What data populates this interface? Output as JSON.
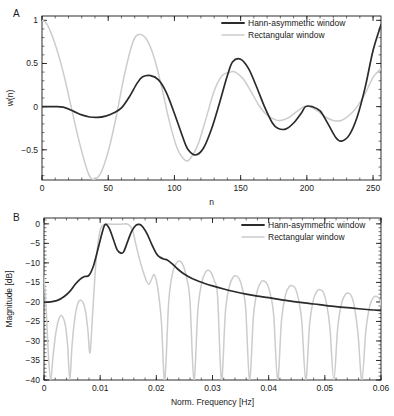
{
  "figure": {
    "width": 394,
    "height": 416,
    "background": "#ffffff",
    "series_colors": {
      "hann_asymmetric": "#2b2b2b",
      "rectangular": "#cccccc"
    }
  },
  "panels": [
    {
      "letter": "A",
      "legend": {
        "entries": [
          {
            "label": "Hann-asymmetric window",
            "color": "#2b2b2b"
          },
          {
            "label": "Rectangular window",
            "color": "#cccccc"
          }
        ]
      },
      "chart_data": {
        "type": "line",
        "title": "",
        "xlabel": "n",
        "ylabel": "w(n)",
        "xlim": [
          0,
          256
        ],
        "ylim": [
          -0.85,
          1.05
        ],
        "xticks": [
          0,
          50,
          100,
          150,
          200,
          250
        ],
        "xticklabels": [
          "0",
          "50",
          "100",
          "150",
          "200",
          "250"
        ],
        "yticks": [
          1,
          0.5,
          0,
          -0.5
        ],
        "yticklabels": [
          "1",
          "0.5",
          "0",
          "−0.5"
        ],
        "x_minor_step": 10,
        "y_minor_step": 0.1,
        "grid": false,
        "legend_position": "top-right",
        "series": [
          {
            "name": "Hann-asymmetric window",
            "color": "#2b2b2b",
            "x": [
              0,
              8,
              16,
              24,
              30,
              36,
              42,
              48,
              54,
              60,
              66,
              72,
              76,
              82,
              88,
              94,
              100,
              106,
              110,
              116,
              122,
              128,
              134,
              140,
              144,
              150,
              156,
              162,
              168,
              174,
              178,
              184,
              190,
              196,
              199,
              204,
              210,
              216,
              222,
              226,
              232,
              238,
              244,
              250,
              256
            ],
            "y": [
              0.0,
              0.0,
              -0.005,
              -0.055,
              -0.095,
              -0.12,
              -0.125,
              -0.11,
              -0.075,
              -0.015,
              0.115,
              0.275,
              0.345,
              0.36,
              0.31,
              0.16,
              -0.08,
              -0.34,
              -0.49,
              -0.56,
              -0.48,
              -0.26,
              0.04,
              0.36,
              0.52,
              0.55,
              0.44,
              0.23,
              0.0,
              -0.19,
              -0.25,
              -0.26,
              -0.19,
              -0.07,
              0.0,
              0.0,
              -0.05,
              -0.2,
              -0.36,
              -0.4,
              -0.33,
              -0.12,
              0.22,
              0.65,
              0.95
            ]
          },
          {
            "name": "Rectangular window",
            "color": "#cccccc",
            "x": [
              0,
              4,
              10,
              16,
              22,
              28,
              34,
              38,
              44,
              50,
              56,
              62,
              68,
              72,
              78,
              84,
              90,
              96,
              102,
              108,
              112,
              118,
              124,
              130,
              136,
              142,
              146,
              152,
              158,
              164,
              170,
              176,
              180,
              186,
              192,
              198,
              202,
              208,
              214,
              220,
              226,
              232,
              238,
              244,
              250,
              256
            ],
            "y": [
              1.0,
              0.95,
              0.72,
              0.4,
              0.0,
              -0.4,
              -0.73,
              -0.84,
              -0.78,
              -0.52,
              -0.12,
              0.35,
              0.72,
              0.83,
              0.8,
              0.6,
              0.25,
              -0.16,
              -0.48,
              -0.62,
              -0.6,
              -0.43,
              -0.13,
              0.18,
              0.36,
              0.4,
              0.4,
              0.32,
              0.17,
              0.01,
              -0.1,
              -0.15,
              -0.16,
              -0.13,
              -0.06,
              0.0,
              0.0,
              -0.05,
              -0.12,
              -0.16,
              -0.16,
              -0.1,
              0.0,
              0.15,
              0.34,
              0.44
            ]
          }
        ]
      }
    },
    {
      "letter": "B",
      "legend": {
        "entries": [
          {
            "label": "Hann-asymmetric window",
            "color": "#2b2b2b"
          },
          {
            "label": "Rectangular window",
            "color": "#cccccc"
          }
        ]
      },
      "chart_data": {
        "type": "line",
        "title": "",
        "xlabel": "Norm. Frequency [Hz]",
        "ylabel": "Magnitude [dB]",
        "xlim": [
          0,
          0.06
        ],
        "ylim": [
          -40,
          1.5
        ],
        "xticks": [
          0,
          0.01,
          0.02,
          0.03,
          0.04,
          0.05,
          0.06
        ],
        "xticklabels": [
          "0",
          "0.01",
          "0.02",
          "0.03",
          "0.04",
          "0.05",
          "0.06"
        ],
        "yticks": [
          0,
          -5,
          -10,
          -15,
          -20,
          -25,
          -30,
          -35,
          -40
        ],
        "yticklabels": [
          "0",
          "−5",
          "−10",
          "−15",
          "−20",
          "−25",
          "−30",
          "−35",
          "−40"
        ],
        "x_minor_step": 0.002,
        "y_minor_step": 1,
        "grid": false,
        "legend_position": "top-right",
        "series": [
          {
            "name": "Hann-asymmetric window",
            "color": "#2b2b2b",
            "x": [
              0.0,
              0.0012,
              0.0024,
              0.0036,
              0.0046,
              0.0056,
              0.0064,
              0.0072,
              0.008,
              0.0088,
              0.0096,
              0.0104,
              0.0109,
              0.0116,
              0.0124,
              0.013,
              0.0137,
              0.0142,
              0.0149,
              0.0156,
              0.0164,
              0.017,
              0.0176,
              0.0184,
              0.0192,
              0.02,
              0.0206,
              0.0213,
              0.022,
              0.0228,
              0.0236,
              0.0245,
              0.0256,
              0.027,
              0.0285,
              0.03,
              0.032,
              0.034,
              0.036,
              0.038,
              0.04,
              0.043,
              0.046,
              0.049,
              0.052,
              0.055,
              0.058,
              0.06
            ],
            "y": [
              -20.1,
              -20.0,
              -19.6,
              -18.6,
              -17.3,
              -15.4,
              -14.2,
              -13.5,
              -13.2,
              -10.8,
              -6.5,
              -2.0,
              -0.15,
              -1.1,
              -4.2,
              -6.6,
              -7.5,
              -7.1,
              -4.5,
              -1.9,
              -0.35,
              -0.15,
              -0.8,
              -2.7,
              -5.3,
              -7.6,
              -8.5,
              -9.0,
              -9.3,
              -10.2,
              -11.3,
              -12.4,
              -13.4,
              -14.4,
              -15.2,
              -15.9,
              -16.7,
              -17.4,
              -18.0,
              -18.5,
              -18.9,
              -19.6,
              -20.2,
              -20.7,
              -21.2,
              -21.6,
              -22.0,
              -22.2
            ]
          },
          {
            "name": "Rectangular window",
            "color": "#cccccc",
            "x": [
              0.0,
              0.0004,
              0.0008,
              0.0012,
              0.0016,
              0.0021,
              0.0026,
              0.003,
              0.0034,
              0.0038,
              0.0042,
              0.0046,
              0.005,
              0.0055,
              0.006,
              0.0065,
              0.007,
              0.0074,
              0.0078,
              0.0082,
              0.0087,
              0.0093,
              0.01,
              0.0108,
              0.0117,
              0.0125,
              0.0133,
              0.0141,
              0.0149,
              0.0157,
              0.0164,
              0.017,
              0.0176,
              0.0182,
              0.0187,
              0.0192,
              0.0196,
              0.02,
              0.0204,
              0.0209,
              0.0215,
              0.0222,
              0.0229,
              0.0236,
              0.0241,
              0.0245,
              0.025,
              0.0255,
              0.026,
              0.0267,
              0.0274,
              0.0281,
              0.0288,
              0.0293,
              0.0298,
              0.0303,
              0.0309,
              0.0316,
              0.0323,
              0.033,
              0.0337,
              0.0343,
              0.0348,
              0.0353,
              0.0359,
              0.0366,
              0.0373,
              0.038,
              0.0387,
              0.0393,
              0.0398,
              0.0403,
              0.0409,
              0.0416,
              0.0423,
              0.043,
              0.0437,
              0.0443,
              0.0448,
              0.0453,
              0.0459,
              0.0466,
              0.0473,
              0.048,
              0.0487,
              0.0493,
              0.0498,
              0.0503,
              0.0509,
              0.0516,
              0.0523,
              0.053,
              0.0537,
              0.0543,
              0.0548,
              0.0553,
              0.0559,
              0.0566,
              0.0573,
              0.058,
              0.0587,
              0.0593,
              0.0598,
              0.06
            ],
            "y": [
              -13.2,
              -22.0,
              -34.0,
              -40.0,
              -34.0,
              -28.0,
              -24.5,
              -23.5,
              -24.0,
              -26.0,
              -31.0,
              -40.0,
              -31.0,
              -24.0,
              -20.5,
              -19.5,
              -20.3,
              -22.5,
              -27.0,
              -33.0,
              -22.0,
              -9.0,
              -1.6,
              -0.1,
              -0.05,
              -0.1,
              -0.08,
              -0.06,
              -0.1,
              -1.4,
              -5.5,
              -9.0,
              -12.0,
              -14.5,
              -15.5,
              -14.0,
              -13.0,
              -14.5,
              -18.0,
              -25.0,
              -40.0,
              -20.0,
              -12.5,
              -10.0,
              -9.5,
              -9.9,
              -11.5,
              -14.5,
              -20.0,
              -40.0,
              -22.0,
              -15.0,
              -12.3,
              -11.9,
              -12.6,
              -14.5,
              -18.5,
              -40.0,
              -22.5,
              -16.0,
              -13.6,
              -13.4,
              -14.2,
              -16.5,
              -21.5,
              -40.0,
              -23.5,
              -17.0,
              -14.8,
              -14.7,
              -15.6,
              -18.0,
              -23.5,
              -40.0,
              -24.5,
              -18.2,
              -16.0,
              -15.9,
              -16.7,
              -19.3,
              -25.0,
              -40.0,
              -25.5,
              -19.2,
              -17.1,
              -16.9,
              -17.7,
              -20.4,
              -26.5,
              -40.0,
              -26.5,
              -20.2,
              -18.0,
              -17.8,
              -18.7,
              -21.5,
              -28.0,
              -40.0,
              -27.5,
              -21.0,
              -18.8,
              -18.6,
              -19.5,
              -21.0
            ]
          }
        ]
      }
    }
  ]
}
